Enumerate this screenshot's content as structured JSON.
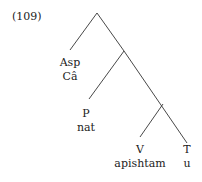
{
  "example_number": "(109)",
  "tree": {
    "nodes": [
      {
        "id": "asp",
        "category": "Asp",
        "word": "Câ"
      },
      {
        "id": "p",
        "category": "P",
        "word": "nat"
      },
      {
        "id": "v",
        "category": "V",
        "word": "apishtam"
      },
      {
        "id": "t",
        "category": "T",
        "word": "u"
      }
    ]
  },
  "colors": {
    "line": "#333333",
    "text": "#222222"
  }
}
